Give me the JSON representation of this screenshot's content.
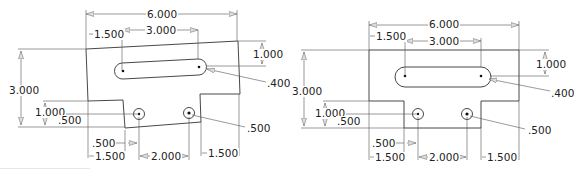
{
  "figure": {
    "colors": {
      "line": "#333333",
      "dimension_line": "#555555",
      "background": "#ffffff",
      "arrow_fill": "#dddddd"
    }
  },
  "drawings": [
    {
      "name": "skewed-sketch",
      "dimensions": {
        "overall_width": "6.000",
        "slot_offset": "1.500",
        "slot_length": "3.000",
        "slot_from_top": "1.000",
        "slot_radius": ".400",
        "overall_height": "3.000",
        "notch_height": "1.000",
        "hole_height": ".500",
        "hole_offset": ".500",
        "left_notch_width": "1.500",
        "hole_spacing": "2.000",
        "right_notch_width": "1.500",
        "hole_diameter": ".500"
      }
    },
    {
      "name": "rectified-drawing",
      "dimensions": {
        "overall_width": "6.000",
        "slot_offset": "1.500",
        "slot_length": "3.000",
        "slot_from_top": "1.000",
        "slot_radius": ".400",
        "overall_height": "3.000",
        "notch_height": "1.000",
        "hole_height": ".500",
        "hole_offset": ".500",
        "left_notch_width": "1.500",
        "hole_spacing": "2.000",
        "right_notch_width": "1.500",
        "hole_diameter": ".500"
      }
    }
  ]
}
